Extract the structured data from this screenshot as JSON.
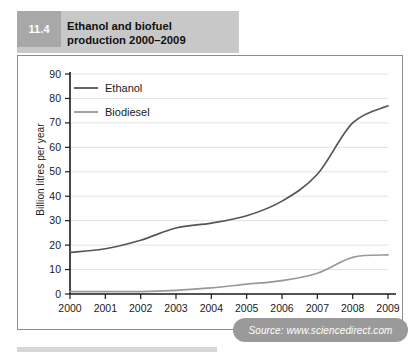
{
  "figure": {
    "number": "11.4",
    "title_line1": "Ethanol and biofuel",
    "title_line2": "production 2000–2009"
  },
  "source": {
    "label": "Source: www.sciencedirect.com"
  },
  "colors": {
    "ethanol_line": "#555555",
    "biodiesel_line": "#999999",
    "gridline": "#e2e2e2",
    "axis": "#1a1a1a",
    "banner_bg": "#c8c8c8",
    "number_bg": "#a8a8a8",
    "badge_bg": "#9a9a9a"
  },
  "chart_data": {
    "type": "line",
    "title": "Ethanol and biofuel production 2000–2009",
    "xlabel": "",
    "ylabel": "Billion litres per year",
    "x": [
      "2000",
      "2001",
      "2002",
      "2003",
      "2004",
      "2005",
      "2006",
      "2007",
      "2008",
      "2009"
    ],
    "categories": [
      "2000",
      "2001",
      "2002",
      "2003",
      "2004",
      "2005",
      "2006",
      "2007",
      "2008",
      "2009"
    ],
    "ylim": [
      0,
      90
    ],
    "yticks": [
      0,
      10,
      20,
      30,
      40,
      50,
      60,
      70,
      80,
      90
    ],
    "grid": true,
    "legend_position": "top-left",
    "series": [
      {
        "name": "Ethanol",
        "color": "#555555",
        "values": [
          17,
          18.5,
          22,
          27,
          29,
          32,
          38,
          49,
          70,
          77
        ]
      },
      {
        "name": "Biodiesel",
        "color": "#999999",
        "values": [
          1,
          1,
          1,
          1.5,
          2.5,
          4,
          5.5,
          8.5,
          15,
          16
        ]
      }
    ]
  }
}
